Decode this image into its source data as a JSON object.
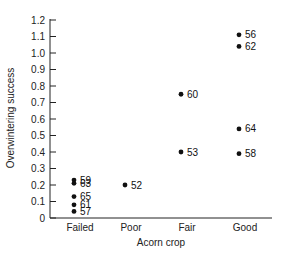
{
  "chart_data": {
    "type": "scatter",
    "title": "",
    "xlabel": "Acorn crop",
    "ylabel": "Overwintering success",
    "categories": [
      "Failed",
      "Poor",
      "Fair",
      "Good"
    ],
    "ylim": [
      0,
      1.2
    ],
    "yticks": [
      0,
      0.1,
      0.2,
      0.3,
      0.4,
      0.5,
      0.6,
      0.7,
      0.8,
      0.9,
      1.0,
      1.1,
      1.2
    ],
    "ytick_labels": [
      "0",
      "0.1",
      "0.2",
      "0.3",
      "0.4",
      "0.5",
      "0.6",
      "0.7",
      "0.8",
      "0.9",
      "1.0",
      "1.1",
      "1.2"
    ],
    "grid": false,
    "legend": "none",
    "points": [
      {
        "category": "Failed",
        "y": 0.23,
        "label": "59"
      },
      {
        "category": "Failed",
        "y": 0.21,
        "label": "63"
      },
      {
        "category": "Failed",
        "y": 0.13,
        "label": "65"
      },
      {
        "category": "Failed",
        "y": 0.08,
        "label": "61"
      },
      {
        "category": "Failed",
        "y": 0.04,
        "label": "57"
      },
      {
        "category": "Poor",
        "y": 0.2,
        "label": "52"
      },
      {
        "category": "Fair",
        "y": 0.75,
        "label": "60"
      },
      {
        "category": "Fair",
        "y": 0.4,
        "label": "53"
      },
      {
        "category": "Good",
        "y": 1.11,
        "label": "56"
      },
      {
        "category": "Good",
        "y": 1.04,
        "label": "62"
      },
      {
        "category": "Good",
        "y": 0.54,
        "label": "64"
      },
      {
        "category": "Good",
        "y": 0.39,
        "label": "58"
      }
    ],
    "colors": {
      "marker": "#111111",
      "axis": "#222222"
    }
  }
}
